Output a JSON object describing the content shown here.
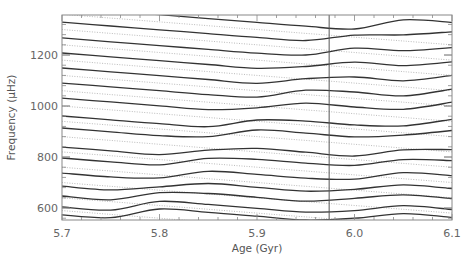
{
  "chart_data": {
    "type": "line",
    "title": "",
    "xlabel": "Age (Gyr)",
    "ylabel": "Frequency (μHz)",
    "xlim": [
      5.7,
      6.1
    ],
    "ylim": [
      553,
      1357
    ],
    "grid": false,
    "legend": null,
    "x_ticks": [
      5.7,
      5.8,
      5.9,
      6.0,
      6.1
    ],
    "x_tick_labels": [
      "5.7",
      "5.8",
      "5.9",
      "6.0",
      "6.1"
    ],
    "y_ticks": [
      600,
      800,
      1000,
      1200
    ],
    "y_tick_labels": [
      "600",
      "800",
      "1000",
      "1200"
    ],
    "x_minor_step": 0.02,
    "y_minor_step": 40,
    "vertical_marker": {
      "age": 5.974,
      "color": "#555555"
    },
    "x": [
      5.7,
      5.75,
      5.8,
      5.85,
      5.9,
      5.95,
      6.0,
      6.05,
      6.1
    ],
    "series": [
      {
        "name": "mode-solid-1",
        "style": "solid",
        "values": [
          573,
          562,
          596,
          583,
          568,
          553,
          560,
          578,
          563
        ]
      },
      {
        "name": "mode-solid-2",
        "style": "solid",
        "values": [
          604,
          592,
          626,
          614,
          599,
          584,
          590,
          609,
          594
        ]
      },
      {
        "name": "mode-solid-3",
        "style": "solid",
        "values": [
          647,
          632,
          660,
          657,
          642,
          627,
          638,
          652,
          637
        ]
      },
      {
        "name": "mode-solid-4",
        "style": "solid",
        "values": [
          686,
          671,
          683,
          696,
          681,
          666,
          673,
          691,
          676
        ]
      },
      {
        "name": "mode-solid-5",
        "style": "solid",
        "values": [
          737,
          722,
          718,
          744,
          732,
          717,
          713,
          739,
          727
        ]
      },
      {
        "name": "mode-solid-6",
        "style": "solid",
        "values": [
          796,
          781,
          769,
          795,
          791,
          776,
          767,
          790,
          786
        ]
      },
      {
        "name": "mode-solid-7",
        "style": "solid",
        "values": [
          839,
          824,
          809,
          827,
          834,
          819,
          804,
          828,
          829
        ]
      },
      {
        "name": "mode-solid-8",
        "style": "solid",
        "values": [
          914,
          899,
          884,
          880,
          906,
          894,
          879,
          886,
          904
        ]
      },
      {
        "name": "mode-solid-9",
        "style": "solid",
        "values": [
          961,
          946,
          931,
          919,
          945,
          941,
          926,
          922,
          948
        ]
      },
      {
        "name": "mode-solid-10",
        "style": "solid",
        "values": [
          1031,
          1016,
          1001,
          986,
          993,
          1011,
          996,
          987,
          1015
        ]
      },
      {
        "name": "mode-solid-11",
        "style": "solid",
        "values": [
          1090,
          1075,
          1060,
          1045,
          1035,
          1062,
          1055,
          1040,
          1066
        ]
      },
      {
        "name": "mode-solid-12",
        "style": "solid",
        "values": [
          1149,
          1134,
          1119,
          1104,
          1089,
          1107,
          1114,
          1099,
          1120
        ]
      },
      {
        "name": "mode-solid-13",
        "style": "solid",
        "values": [
          1208,
          1193,
          1178,
          1163,
          1148,
          1155,
          1172,
          1158,
          1173
        ]
      },
      {
        "name": "mode-solid-14",
        "style": "solid",
        "values": [
          1267,
          1252,
          1237,
          1222,
          1207,
          1200,
          1227,
          1217,
          1229
        ]
      },
      {
        "name": "mode-solid-15",
        "style": "solid",
        "values": [
          1329,
          1314,
          1299,
          1284,
          1269,
          1257,
          1278,
          1279,
          1291
        ]
      },
      {
        "name": "mode-solid-16",
        "style": "solid",
        "values": [
          1388,
          1373,
          1358,
          1343,
          1328,
          1313,
          1302,
          1338,
          1328
        ]
      },
      {
        "name": "mode-dotted-1",
        "style": "dotted",
        "values": [
          1360,
          1345,
          1330,
          1315,
          1300,
          1285,
          1270,
          1255,
          1240
        ]
      },
      {
        "name": "mode-dotted-2",
        "style": "dotted",
        "values": [
          1300,
          1285,
          1270,
          1255,
          1240,
          1225,
          1210,
          1195,
          1180
        ]
      },
      {
        "name": "mode-dotted-3",
        "style": "dotted",
        "values": [
          1240,
          1225,
          1210,
          1195,
          1180,
          1165,
          1150,
          1135,
          1120
        ]
      },
      {
        "name": "mode-dotted-4",
        "style": "dotted",
        "values": [
          1180,
          1165,
          1150,
          1135,
          1120,
          1105,
          1090,
          1075,
          1060
        ]
      },
      {
        "name": "mode-dotted-5",
        "style": "dotted",
        "values": [
          1120,
          1105,
          1090,
          1075,
          1060,
          1045,
          1030,
          1015,
          1000
        ]
      },
      {
        "name": "mode-dotted-6",
        "style": "dotted",
        "values": [
          1060,
          1045,
          1030,
          1015,
          1000,
          985,
          970,
          955,
          940
        ]
      },
      {
        "name": "mode-dotted-7",
        "style": "dotted",
        "values": [
          1000,
          985,
          970,
          955,
          940,
          925,
          910,
          895,
          880
        ]
      },
      {
        "name": "mode-dotted-8",
        "style": "dotted",
        "values": [
          940,
          925,
          910,
          895,
          880,
          865,
          850,
          835,
          820
        ]
      },
      {
        "name": "mode-dotted-9",
        "style": "dotted",
        "values": [
          880,
          865,
          850,
          835,
          820,
          805,
          790,
          775,
          760
        ]
      },
      {
        "name": "mode-dotted-10",
        "style": "dotted",
        "values": [
          820,
          805,
          790,
          775,
          760,
          745,
          730,
          715,
          700
        ]
      },
      {
        "name": "mode-dotted-11",
        "style": "dotted",
        "values": [
          760,
          745,
          730,
          715,
          700,
          685,
          670,
          655,
          640
        ]
      },
      {
        "name": "mode-dotted-12",
        "style": "dotted",
        "values": [
          700,
          685,
          670,
          655,
          640,
          625,
          610,
          595,
          580
        ]
      },
      {
        "name": "mode-dotted-13",
        "style": "dotted",
        "values": [
          640,
          625,
          610,
          595,
          580,
          565,
          550,
          535,
          520
        ]
      },
      {
        "name": "mode-dotted-14",
        "style": "dotted",
        "values": [
          590,
          575,
          560,
          545,
          530,
          515,
          500,
          485,
          470
        ]
      }
    ]
  },
  "layout_px": {
    "left": 62,
    "right": 452,
    "top": 15,
    "bottom": 220
  }
}
